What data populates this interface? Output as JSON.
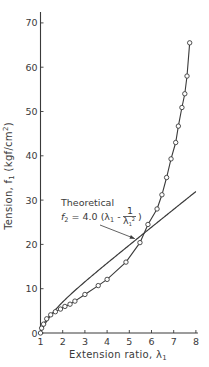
{
  "chart_data": {
    "type": "line",
    "title": "",
    "xlabel": "Extension ratio, λ₁",
    "ylabel": "Tension, f₁ (kgf/cm²)",
    "xlim": [
      1,
      8
    ],
    "ylim": [
      0,
      70
    ],
    "xticks": [
      1,
      2,
      3,
      4,
      5,
      6,
      7,
      8
    ],
    "yticks": [
      0,
      10,
      20,
      30,
      40,
      50,
      60,
      70
    ],
    "grid": false,
    "legend": null,
    "series": [
      {
        "name": "Experimental",
        "style": "line-with-open-circles",
        "points": [
          [
            1.0,
            0.0
          ],
          [
            1.05,
            1.1
          ],
          [
            1.14,
            2.0
          ],
          [
            1.28,
            3.2
          ],
          [
            1.46,
            4.1
          ],
          [
            1.67,
            4.8
          ],
          [
            1.9,
            5.4
          ],
          [
            2.1,
            6.0
          ],
          [
            2.33,
            6.5
          ],
          [
            2.55,
            7.2
          ],
          [
            3.0,
            8.7
          ],
          [
            3.6,
            10.7
          ],
          [
            4.0,
            12.1
          ],
          [
            4.85,
            16.0
          ],
          [
            5.48,
            20.4
          ],
          [
            5.84,
            24.5
          ],
          [
            6.25,
            28.0
          ],
          [
            6.47,
            31.2
          ],
          [
            6.68,
            35.1
          ],
          [
            6.88,
            39.3
          ],
          [
            7.09,
            43.0
          ],
          [
            7.21,
            46.7
          ],
          [
            7.37,
            50.9
          ],
          [
            7.5,
            54.0
          ],
          [
            7.6,
            58.0
          ],
          [
            7.72,
            65.5
          ]
        ]
      },
      {
        "name": "Theoretical",
        "style": "line",
        "formula": "f2 = 4.0 (λ1 - 1/λ1²)",
        "points": [
          [
            1.0,
            0.0
          ],
          [
            1.2,
            1.42
          ],
          [
            1.5,
            3.22
          ],
          [
            2.0,
            7.0
          ],
          [
            2.5,
            9.36
          ],
          [
            3.0,
            11.56
          ],
          [
            4.0,
            15.75
          ],
          [
            5.0,
            19.84
          ],
          [
            6.0,
            23.89
          ],
          [
            7.0,
            27.92
          ],
          [
            8.0,
            31.94
          ]
        ]
      }
    ],
    "annotations": [
      {
        "line1": "Theoretical",
        "line2_prefix": "f",
        "line2_sub": "2",
        "line2_formula": " = 4.0 (λ",
        "line2_sub2": "1",
        "line2_minus": " - ",
        "frac_num": "1",
        "frac_den": "λ",
        "frac_den_sub": "1",
        "frac_den_sup": "2",
        "close": ")",
        "arrow_to": [
          5.25,
          21.3
        ]
      }
    ]
  },
  "labels": {
    "xlabel_text": "Extension ratio, λ",
    "xlabel_sub": "1",
    "ylabel_text": "Tension, f",
    "ylabel_sub": "1",
    "ylabel_units": " (kgf/cm",
    "ylabel_sup": "2",
    "ylabel_close": ")"
  },
  "colors": {
    "ink": "#3a3a3a",
    "background": "#ffffff"
  }
}
